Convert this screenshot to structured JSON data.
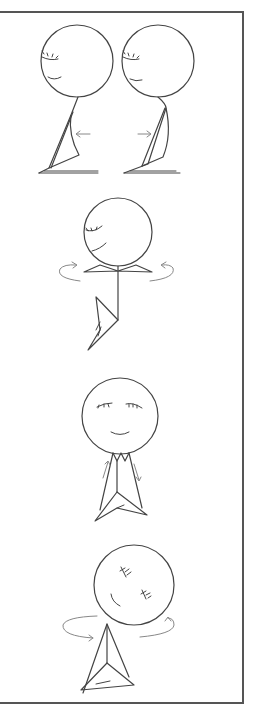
{
  "illustration": {
    "description": "Four stick-figure exercise illustrations in a framed panel",
    "panels": [
      {
        "name": "back-bend",
        "figures": 2,
        "arrows": [
          "left",
          "right"
        ]
      },
      {
        "name": "hip-twist",
        "figures": 1,
        "arrows": [
          "rotate-left",
          "rotate-right"
        ]
      },
      {
        "name": "arm-slide",
        "figures": 1,
        "arrows": [
          "up",
          "down"
        ]
      },
      {
        "name": "torso-rotate",
        "figures": 1,
        "arrows": [
          "rotate-left",
          "rotate-right"
        ]
      }
    ],
    "colors": {
      "line": "#444444",
      "arrow": "#777777",
      "frame": "#555555",
      "background": "#ffffff"
    }
  }
}
